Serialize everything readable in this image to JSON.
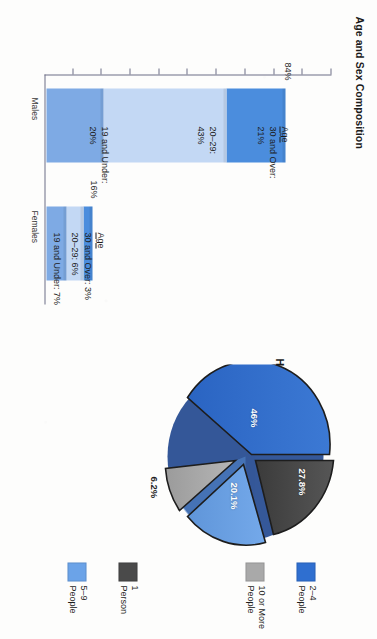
{
  "page": {
    "orientation_deg": 90
  },
  "bar_chart": {
    "title": "Age and Sex Composition",
    "y_axis_title": "Percentage of Population",
    "y_ticks": [
      "100",
      "90",
      "80",
      "70",
      "60",
      "50",
      "40",
      "30",
      "20",
      "10"
    ],
    "categories": [
      "Males",
      "Females"
    ],
    "totals": [
      "84%",
      "16%"
    ],
    "legend_heading": "Age",
    "series": [
      {
        "name": "19 and Under",
        "color": "#7eaae4"
      },
      {
        "name": "20–29",
        "color": "#c3d8f4"
      },
      {
        "name": "30 and Over",
        "color": "#4b8ddd"
      }
    ],
    "annotations": {
      "males": [
        {
          "label": "Age",
          "underline": true
        },
        {
          "label": "30 and Over:"
        },
        {
          "label": "21%"
        },
        {
          "label": "20–29:"
        },
        {
          "label": "43%"
        },
        {
          "label": "19 and Under:"
        },
        {
          "label": "20%"
        }
      ],
      "females": [
        {
          "label": "Age",
          "underline": true
        },
        {
          "label": "30 and Over: 3%"
        },
        {
          "label": "20–29: 6%"
        },
        {
          "label": "19 and Under: 7%"
        }
      ]
    }
  },
  "pie_chart": {
    "title": "Household Size",
    "legend": [
      {
        "label_line1": "1",
        "label_line2": "Person",
        "color": "#4a4a4a"
      },
      {
        "label_line1": "2–4",
        "label_line2": "People",
        "color": "#2f6fd0"
      },
      {
        "label_line1": "5–9",
        "label_line2": "People",
        "color": "#6ba3e8"
      },
      {
        "label_line1": "10 or More",
        "label_line2": "People",
        "color": "#a9a9a9"
      }
    ],
    "slice_labels": [
      "46%",
      "27.8%",
      "20.1%",
      "6.2%"
    ]
  },
  "chart_data": [
    {
      "type": "bar",
      "subtype": "stacked-column",
      "title": "Age and Sex Composition",
      "xlabel": "",
      "ylabel": "Percentage of Population",
      "ylim": [
        0,
        100
      ],
      "ytick_step": 10,
      "yticks": [
        10,
        20,
        30,
        40,
        50,
        60,
        70,
        80,
        90,
        100
      ],
      "grid": false,
      "legend_position": "annotated-inline",
      "categories": [
        "Males",
        "Females"
      ],
      "series": [
        {
          "name": "19 and Under",
          "values": [
            20,
            7
          ],
          "color": "#7eaae4"
        },
        {
          "name": "20–29",
          "values": [
            43,
            6
          ],
          "color": "#c3d8f4"
        },
        {
          "name": "30 and Over",
          "values": [
            21,
            3
          ],
          "color": "#4b8ddd"
        }
      ],
      "totals": [
        84,
        16
      ],
      "total_labels": [
        "84%",
        "16%"
      ],
      "annotations": [
        "Age",
        "30 and Over: 21%",
        "20–29: 43%",
        "19 and Under: 20%",
        "Age",
        "30 and Over: 3%",
        "20–29: 6%",
        "19 and Under: 7%"
      ]
    },
    {
      "type": "pie",
      "title": "Household Size",
      "exploded": true,
      "legend_position": "right",
      "labels": [
        "2–4 People",
        "1 Person",
        "5–9 People",
        "10 or More People"
      ],
      "values": [
        46,
        27.8,
        20.1,
        6.2
      ],
      "value_labels": [
        "46%",
        "27.8%",
        "20.1%",
        "6.2%"
      ],
      "colors": [
        "#2f6fd0",
        "#4a4a4a",
        "#6ba3e8",
        "#a9a9a9"
      ]
    }
  ]
}
